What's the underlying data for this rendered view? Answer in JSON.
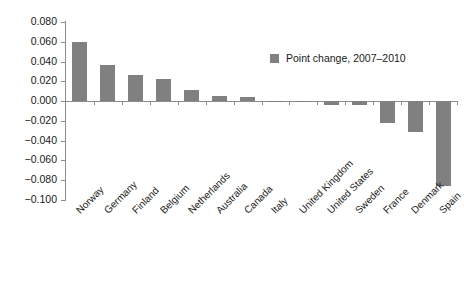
{
  "chart_data": {
    "type": "bar",
    "title": "",
    "xlabel": "",
    "ylabel": "",
    "ylim": [
      -0.1,
      0.08
    ],
    "ytick_labels": [
      "0.080",
      "0.060",
      "0.040",
      "0.020",
      "0.000",
      "-0.020",
      "-0.040",
      "-0.060",
      "-0.080",
      "-0.100"
    ],
    "ytick_values": [
      0.08,
      0.06,
      0.04,
      0.02,
      0.0,
      -0.02,
      -0.04,
      -0.06,
      -0.08,
      -0.1
    ],
    "grid": false,
    "legend_position": "upper-right-inside",
    "bar_color": "#808080",
    "axis_color": "#8c8c8c",
    "categories": [
      "Norway",
      "Germany",
      "Finland",
      "Belgium",
      "Netherlands",
      "Australia",
      "Canada",
      "Italy",
      "United Kingdom",
      "United States",
      "Sweden",
      "France",
      "Denmark",
      "Spain"
    ],
    "series": [
      {
        "name": "Point change, 2007–2010",
        "values": [
          0.06,
          0.037,
          0.026,
          0.022,
          0.011,
          0.005,
          0.004,
          0.0,
          -0.001,
          -0.004,
          -0.004,
          -0.022,
          -0.031,
          -0.086
        ]
      }
    ],
    "legend": [
      "Point change, 2007–2010"
    ]
  }
}
